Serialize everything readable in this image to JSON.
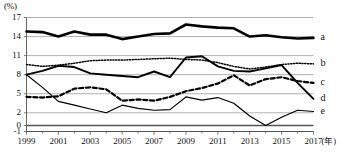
{
  "chart_data": {
    "type": "line",
    "title": "",
    "xlabel": "年",
    "ylabel": "(%)",
    "unit_label": "(%)",
    "x_unit_suffix": "(年)",
    "grid": true,
    "legend_position": "right-inline",
    "ylim": [
      -1,
      17
    ],
    "xlim": [
      1999,
      2017
    ],
    "ytick_labels": [
      "17",
      "14",
      "11",
      "8",
      "5",
      "2",
      "0",
      "-1"
    ],
    "ytick_values": [
      17,
      14,
      11,
      8,
      5,
      2,
      0,
      -1
    ],
    "xtick_labels": [
      "1999",
      "2001",
      "2003",
      "2005",
      "2007",
      "2009",
      "2011",
      "2013",
      "2015",
      "2017"
    ],
    "xtick_values": [
      1999,
      2001,
      2003,
      2005,
      2007,
      2009,
      2011,
      2013,
      2015,
      2017
    ],
    "x": [
      1999,
      2000,
      2001,
      2002,
      2003,
      2004,
      2005,
      2006,
      2007,
      2008,
      2009,
      2010,
      2011,
      2012,
      2013,
      2014,
      2015,
      2016,
      2017
    ],
    "series": [
      {
        "name": "a",
        "label": "a",
        "style": "solid-bold",
        "color": "#000000",
        "width": 2.6,
        "values": [
          14.8,
          14.7,
          14.0,
          14.8,
          14.3,
          14.3,
          13.6,
          14.0,
          14.4,
          14.5,
          15.9,
          15.6,
          15.4,
          15.3,
          14.0,
          14.2,
          13.9,
          13.7,
          13.8
        ]
      },
      {
        "name": "b",
        "label": "b",
        "style": "dotted",
        "color": "#000000",
        "width": 1.5,
        "values": [
          9.6,
          9.3,
          9.5,
          9.8,
          10.2,
          10.3,
          10.3,
          10.4,
          10.5,
          10.6,
          10.4,
          10.3,
          9.9,
          9.3,
          8.9,
          9.2,
          9.6,
          9.8,
          9.7
        ]
      },
      {
        "name": "c",
        "label": "c",
        "style": "dashed",
        "color": "#000000",
        "width": 2.2,
        "values": [
          4.5,
          4.4,
          4.6,
          5.8,
          6.0,
          5.7,
          3.9,
          4.1,
          3.9,
          4.5,
          5.4,
          5.9,
          6.6,
          7.9,
          6.3,
          7.3,
          7.6,
          7.0,
          6.7
        ]
      },
      {
        "name": "d",
        "label": "d",
        "style": "solid",
        "color": "#000000",
        "width": 1.9,
        "values": [
          8.0,
          8.6,
          9.4,
          9.2,
          8.2,
          8.0,
          7.8,
          7.6,
          8.5,
          7.6,
          10.7,
          10.9,
          9.3,
          8.6,
          8.5,
          9.0,
          9.5,
          6.7,
          4.2
        ]
      },
      {
        "name": "e",
        "label": "e",
        "style": "thin-solid",
        "color": "#000000",
        "width": 1.2,
        "values": [
          8.0,
          6.0,
          3.8,
          3.2,
          2.6,
          2.0,
          3.2,
          2.7,
          2.4,
          2.5,
          4.5,
          4.0,
          4.4,
          3.5,
          1.5,
          0.0,
          1.3,
          2.4,
          2.2
        ]
      }
    ]
  }
}
